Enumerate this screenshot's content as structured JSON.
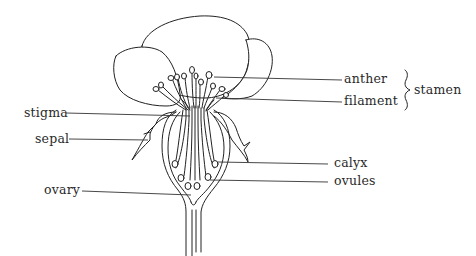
{
  "diagram": {
    "labels": {
      "anther": "anther",
      "filament": "filament",
      "stamen": "stamen",
      "stigma": "stigma",
      "sepal": "sepal",
      "calyx": "calyx",
      "ovules": "ovules",
      "ovary": "ovary"
    },
    "groupings": [
      {
        "group": "stamen",
        "members": [
          "anther",
          "filament"
        ],
        "marker": "curly-brace"
      }
    ],
    "colors": {
      "line": "#222222",
      "text": "#2a2a2a",
      "background": "#ffffff"
    }
  }
}
